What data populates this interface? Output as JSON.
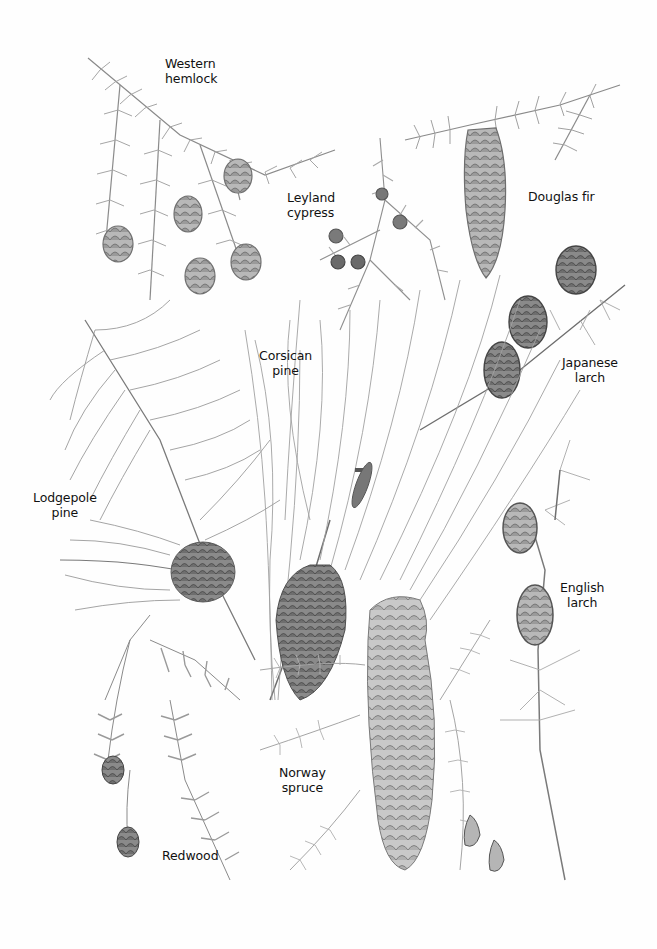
{
  "illustration": {
    "subject": "Conifer branches and cones, pencil illustration",
    "colors": {
      "background": "#fefefe",
      "ink": "#111111",
      "pencil_light": "#9a9a9a",
      "pencil_dark": "#555555"
    },
    "labels": [
      {
        "id": "western-hemlock",
        "text": "Western\nhemlock",
        "x": 165,
        "y": 56
      },
      {
        "id": "leyland-cypress",
        "text": "Leyland\ncypress",
        "x": 287,
        "y": 190
      },
      {
        "id": "douglas-fir",
        "text": "Douglas fir",
        "x": 528,
        "y": 189
      },
      {
        "id": "corsican-pine",
        "text": "Corsican\npine",
        "x": 259,
        "y": 348
      },
      {
        "id": "japanese-larch",
        "text": "Japanese\nlarch",
        "x": 562,
        "y": 355
      },
      {
        "id": "lodgepole-pine",
        "text": "Lodgepole\npine",
        "x": 33,
        "y": 490
      },
      {
        "id": "english-larch",
        "text": "English\nlarch",
        "x": 560,
        "y": 580
      },
      {
        "id": "norway-spruce",
        "text": "Norway\nspruce",
        "x": 279,
        "y": 765
      },
      {
        "id": "redwood",
        "text": "Redwood",
        "x": 162,
        "y": 848
      }
    ]
  }
}
